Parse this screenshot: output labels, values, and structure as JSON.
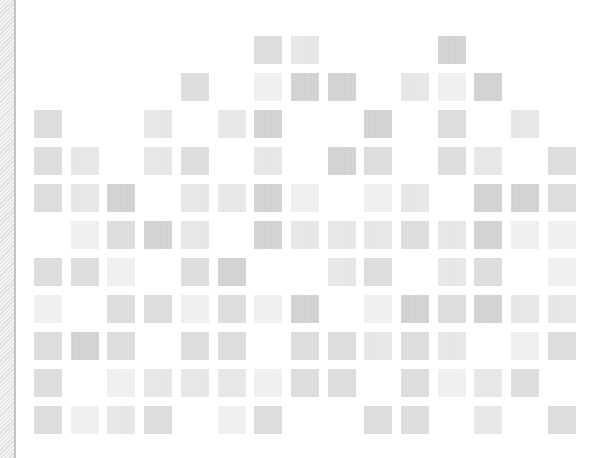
{
  "layout": {
    "origin_x": 34,
    "origin_y": 36,
    "pitch_x": 36.7,
    "pitch_y": 37,
    "cell_size": 28,
    "columns": 15,
    "rows": 11
  },
  "palette": {
    "1": "#efefef",
    "2": "#e6e6e6",
    "3": "#dcdcdc",
    "4": "#d1d1d1"
  },
  "side_strip": {
    "hatch_light": "#f2f2f2",
    "hatch_dark": "#dedede",
    "line": "#c4c4c4"
  },
  "grid_rows": [
    {
      "row": 0,
      "cells": [
        [
          6,
          3
        ],
        [
          7,
          2
        ],
        [
          11,
          4
        ]
      ]
    },
    {
      "row": 1,
      "cells": [
        [
          4,
          3
        ],
        [
          6,
          1
        ],
        [
          7,
          4
        ],
        [
          8,
          4
        ],
        [
          10,
          2
        ],
        [
          11,
          1
        ],
        [
          12,
          4
        ]
      ]
    },
    {
      "row": 2,
      "cells": [
        [
          0,
          3
        ],
        [
          3,
          2
        ],
        [
          5,
          2
        ],
        [
          6,
          4
        ],
        [
          9,
          4
        ],
        [
          11,
          3
        ],
        [
          13,
          2
        ]
      ]
    },
    {
      "row": 3,
      "cells": [
        [
          0,
          3
        ],
        [
          1,
          2
        ],
        [
          3,
          2
        ],
        [
          4,
          3
        ],
        [
          6,
          2
        ],
        [
          8,
          4
        ],
        [
          9,
          3
        ],
        [
          11,
          3
        ],
        [
          12,
          2
        ],
        [
          14,
          3
        ]
      ]
    },
    {
      "row": 4,
      "cells": [
        [
          0,
          3
        ],
        [
          1,
          2
        ],
        [
          2,
          4
        ],
        [
          4,
          2
        ],
        [
          5,
          2
        ],
        [
          6,
          4
        ],
        [
          7,
          1
        ],
        [
          9,
          1
        ],
        [
          10,
          2
        ],
        [
          12,
          4
        ],
        [
          13,
          4
        ],
        [
          14,
          3
        ]
      ]
    },
    {
      "row": 5,
      "cells": [
        [
          1,
          1
        ],
        [
          2,
          3
        ],
        [
          3,
          4
        ],
        [
          4,
          2
        ],
        [
          6,
          4
        ],
        [
          7,
          2
        ],
        [
          8,
          2
        ],
        [
          9,
          2
        ],
        [
          10,
          3
        ],
        [
          11,
          2
        ],
        [
          12,
          4
        ],
        [
          13,
          1
        ],
        [
          14,
          1
        ]
      ]
    },
    {
      "row": 6,
      "cells": [
        [
          0,
          3
        ],
        [
          1,
          3
        ],
        [
          2,
          1
        ],
        [
          4,
          3
        ],
        [
          5,
          4
        ],
        [
          8,
          2
        ],
        [
          9,
          3
        ],
        [
          11,
          2
        ],
        [
          12,
          3
        ],
        [
          14,
          1
        ]
      ]
    },
    {
      "row": 7,
      "cells": [
        [
          0,
          1
        ],
        [
          2,
          3
        ],
        [
          3,
          3
        ],
        [
          4,
          1
        ],
        [
          5,
          3
        ],
        [
          6,
          1
        ],
        [
          7,
          4
        ],
        [
          9,
          1
        ],
        [
          10,
          4
        ],
        [
          11,
          3
        ],
        [
          12,
          4
        ],
        [
          13,
          2
        ],
        [
          14,
          2
        ]
      ]
    },
    {
      "row": 8,
      "cells": [
        [
          0,
          3
        ],
        [
          1,
          4
        ],
        [
          2,
          3
        ],
        [
          4,
          3
        ],
        [
          5,
          3
        ],
        [
          7,
          3
        ],
        [
          8,
          3
        ],
        [
          9,
          2
        ],
        [
          10,
          3
        ],
        [
          11,
          2
        ],
        [
          13,
          1
        ],
        [
          14,
          3
        ]
      ]
    },
    {
      "row": 9,
      "cells": [
        [
          0,
          3
        ],
        [
          2,
          1
        ],
        [
          3,
          2
        ],
        [
          4,
          2
        ],
        [
          5,
          2
        ],
        [
          6,
          1
        ],
        [
          7,
          3
        ],
        [
          8,
          3
        ],
        [
          10,
          3
        ],
        [
          11,
          1
        ],
        [
          12,
          2
        ],
        [
          13,
          3
        ]
      ]
    },
    {
      "row": 10,
      "cells": [
        [
          0,
          3
        ],
        [
          1,
          1
        ],
        [
          2,
          2
        ],
        [
          3,
          3
        ],
        [
          5,
          1
        ],
        [
          6,
          3
        ],
        [
          9,
          3
        ],
        [
          10,
          3
        ],
        [
          12,
          2
        ],
        [
          14,
          3
        ]
      ]
    }
  ]
}
